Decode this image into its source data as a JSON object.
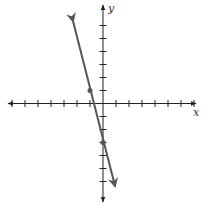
{
  "chart_data": {
    "type": "line",
    "title": "",
    "xlabel": "x",
    "ylabel": "y",
    "xlim": [
      -7.5,
      7.5
    ],
    "ylim": [
      -7,
      6.5
    ],
    "grid": false,
    "x_ticks": [
      -7,
      -6,
      -5,
      -4,
      -3,
      -2,
      -1,
      1,
      2,
      3,
      4,
      5,
      6,
      7
    ],
    "y_ticks": [
      -6,
      -5,
      -4,
      -3,
      -2,
      -1,
      1,
      2,
      3,
      4,
      5,
      6
    ],
    "series": [
      {
        "name": "line",
        "equation": "y = -4x - 3",
        "color": "#555555",
        "arrows": "both",
        "points": [
          {
            "x": -1,
            "y": 1
          },
          {
            "x": 0,
            "y": -3
          }
        ]
      }
    ]
  },
  "labels": {
    "x_axis": "x",
    "y_axis": "y"
  },
  "colors": {
    "axis": "#222222",
    "line": "#555555"
  }
}
